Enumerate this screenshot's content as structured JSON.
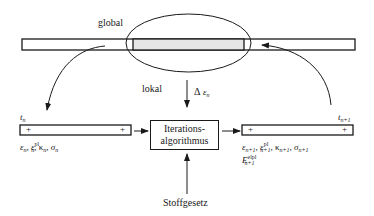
{
  "diagram": {
    "labels": {
      "global": "global",
      "lokal": "lokal",
      "delta_symbol": "Δ",
      "delta_eps": "ε",
      "delta_sub": "n",
      "algorithm_line1": "Iterations-",
      "algorithm_line2": "algorithmus",
      "material_law": "Stoffgesetz"
    },
    "left_state": {
      "time": "t",
      "time_sub": "n",
      "plus_left": "+",
      "plus_right": "+",
      "vars": {
        "eps": "ε",
        "eps_sub": "n",
        "epspl": "ε",
        "epspl_sup": "pl",
        "epspl_sub": "n",
        "kappa": "κ",
        "kappa_sub": "n",
        "sigma": "σ",
        "sigma_sub": "n",
        "sep": ","
      }
    },
    "right_state": {
      "time": "t",
      "time_sub": "n+1",
      "plus_left": "+",
      "plus_right": "+",
      "vars": {
        "eps": "ε",
        "eps_sub": "n+1",
        "epspl": "ε",
        "epspl_sup": "pl",
        "epspl_sub": "n+1",
        "kappa": "κ",
        "kappa_sub": "n+1",
        "sigma": "σ",
        "sigma_sub": "n+1",
        "E": "E",
        "E_sup": "elpl",
        "E_sub": "n+1",
        "sep": ","
      }
    },
    "colors": {
      "stroke": "#1a1a1a",
      "shaded": "#e6e6e6",
      "background": "#ffffff"
    }
  }
}
